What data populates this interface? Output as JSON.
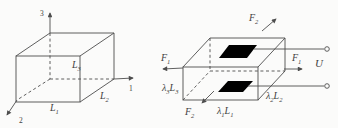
{
  "diagram": {
    "left": {
      "axes": {
        "axis3": "3",
        "axis1": "1",
        "axis2": "2"
      },
      "dims": {
        "L3": {
          "base": "L",
          "sub": "3"
        },
        "L1": {
          "base": "L",
          "sub": "1"
        },
        "L2": {
          "base": "L",
          "sub": "2"
        }
      }
    },
    "right": {
      "forces": {
        "f2_top": {
          "base": "F",
          "sub": "2"
        },
        "f1_left": {
          "base": "F",
          "sub": "1"
        },
        "f1_right": {
          "base": "F",
          "sub": "1"
        },
        "f2_bottom": {
          "base": "F",
          "sub": "2"
        }
      },
      "dims": {
        "d3": {
          "lambda": "λ",
          "lambda_sub": "3",
          "L": "L",
          "L_sub": "3"
        },
        "d1": {
          "lambda": "λ",
          "lambda_sub": "1",
          "L": "L",
          "L_sub": "1"
        },
        "d2": {
          "lambda": "λ",
          "lambda_sub": "2",
          "L": "L",
          "L_sub": "2"
        }
      },
      "voltage": "U"
    },
    "colors": {
      "line": "#4d4d4d",
      "electrode": "#000000",
      "background": "#fbfbfa"
    }
  }
}
